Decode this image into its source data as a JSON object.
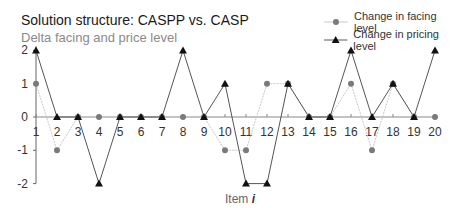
{
  "chart_data": {
    "type": "line",
    "title": "Solution structure: CASPP vs. CASP",
    "subtitle": "Delta facing and price level",
    "xlabel": "Item",
    "xlabel_var": "i",
    "ylabel": "",
    "x": [
      1,
      2,
      3,
      4,
      5,
      6,
      7,
      8,
      9,
      10,
      11,
      12,
      13,
      14,
      15,
      16,
      17,
      18,
      19,
      20
    ],
    "ylim": [
      -2,
      2
    ],
    "yticks": [
      2,
      1,
      0,
      -1,
      -2
    ],
    "grid": false,
    "legend_position": "top-right",
    "series": [
      {
        "name": "Change in facing level",
        "marker": "circle",
        "color": "#7a7a7a",
        "line_color": "#c8c8c8",
        "values": [
          1,
          -1,
          0,
          0,
          0,
          0,
          0,
          0,
          0,
          -1,
          -1,
          1,
          1,
          0,
          0,
          1,
          -1,
          1,
          0,
          0
        ]
      },
      {
        "name": "Change in pricing level",
        "marker": "triangle",
        "color": "#111111",
        "line_color": "#555555",
        "values": [
          2,
          0,
          0,
          -2,
          0,
          0,
          0,
          2,
          0,
          1,
          -2,
          -2,
          1,
          0,
          0,
          2,
          0,
          1,
          0,
          2
        ]
      }
    ]
  },
  "header": {
    "title": "Solution structure: CASPP vs. CASP",
    "subtitle": "Delta facing and price level"
  },
  "legend": {
    "items": [
      {
        "label": "Change in facing level",
        "icon": "circle-marker-icon"
      },
      {
        "label": "Change in pricing level",
        "icon": "triangle-marker-icon"
      }
    ]
  },
  "axes": {
    "x_title": "Item ",
    "x_var": "i"
  }
}
